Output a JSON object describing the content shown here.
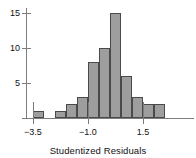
{
  "chart_data": {
    "type": "bar",
    "title": "",
    "subtitle": "",
    "xlabel": "Studentized Residuals",
    "ylabel": "",
    "grid": false,
    "legend": null,
    "bin_width": 0.5,
    "categories": [
      "-3.5",
      "-3.0",
      "-2.5",
      "-2.0",
      "-1.5",
      "-1.0",
      "-0.5",
      "0.0",
      "0.5",
      "1.0",
      "1.5",
      "2.0"
    ],
    "bin_starts": [
      -3.5,
      -3.0,
      -2.5,
      -2.0,
      -1.5,
      -1.0,
      -0.5,
      0.0,
      0.5,
      1.0,
      1.5,
      2.0
    ],
    "values": [
      1,
      0,
      1,
      2,
      3,
      8,
      10,
      15,
      6,
      3,
      2,
      2
    ],
    "xlim": [
      -3.75,
      2.75
    ],
    "ylim": [
      0,
      16
    ],
    "x_ticks": [
      -3.5,
      -1.0,
      1.5
    ],
    "x_tick_labels": [
      "−3.5",
      "−1.0",
      "1.5"
    ],
    "y_ticks": [
      5,
      10,
      15
    ],
    "y_tick_labels": [
      "5",
      "10",
      "15"
    ],
    "bar_fill_color": "#9e9e9e",
    "bar_edge_color": "#4a4a4a",
    "axis_color": "#7d7d7d",
    "text_color": "#111111"
  }
}
